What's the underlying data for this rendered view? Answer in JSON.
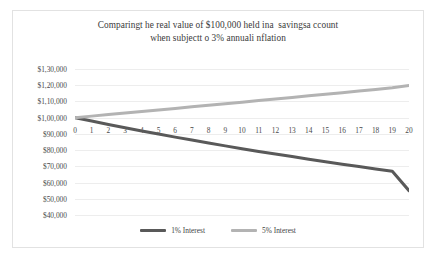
{
  "chart_data": {
    "type": "line",
    "title": "Comparingt he real value of $100,000 held ina  savingsa ccount\nwhen subjectt o 3% annuali nflation",
    "title_lines": [
      "Comparingt he real value of $100,000 held ina  savingsa ccount",
      "when subjectt o 3% annuali nflation"
    ],
    "xlabel": "",
    "ylabel": "",
    "x": [
      0,
      1,
      2,
      3,
      4,
      5,
      6,
      7,
      8,
      9,
      10,
      11,
      12,
      13,
      14,
      15,
      16,
      17,
      18,
      19,
      20
    ],
    "xtick_labels": [
      "0",
      "1",
      "2",
      "3",
      "4",
      "5",
      "6",
      "7",
      "8",
      "9",
      "10",
      "11",
      "12",
      "13",
      "14",
      "15",
      "16",
      "17",
      "18",
      "19",
      "20"
    ],
    "ytick_labels": [
      "$1,30,000",
      "$1,20,000",
      "$1,10,000",
      "$1,00,000",
      "$90,000",
      "$80,000",
      "$70,000",
      "$60,000",
      "$50,000",
      "$40,000"
    ],
    "ytick_values": [
      130000,
      120000,
      110000,
      100000,
      90000,
      80000,
      70000,
      60000,
      50000,
      40000
    ],
    "ylim": [
      40000,
      130000
    ],
    "xlim": [
      0,
      20
    ],
    "grid": "horizontal",
    "legend_position": "bottom",
    "series": [
      {
        "name": "1% Interest",
        "color": "#595959",
        "values": [
          100000,
          97900,
          95800,
          93800,
          91800,
          89900,
          88000,
          86200,
          84400,
          82600,
          80900,
          79200,
          77600,
          76000,
          74400,
          72800,
          71300,
          69900,
          68400,
          67000,
          55000
        ]
      },
      {
        "name": "5% Interest",
        "color": "#b3b3b3",
        "values": [
          100000,
          100950,
          101900,
          102850,
          103800,
          104760,
          105720,
          106680,
          107640,
          108600,
          109560,
          110530,
          111500,
          112470,
          113440,
          114400,
          115400,
          116400,
          117400,
          118400,
          119800
        ]
      }
    ]
  },
  "legend": {
    "items": [
      {
        "label": "1% Interest",
        "color": "#595959"
      },
      {
        "label": "5% Interest",
        "color": "#b3b3b3"
      }
    ]
  },
  "style": {
    "border_color": "#e2e2e2",
    "grid_color": "#ededed",
    "text_color": "#3a3a3a",
    "background": "#ffffff"
  }
}
